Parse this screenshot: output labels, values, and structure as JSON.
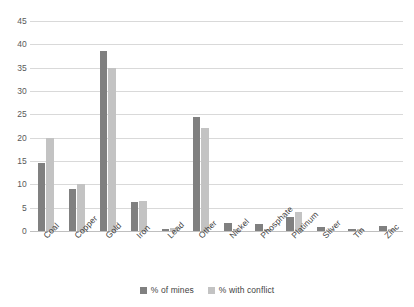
{
  "chart_data": {
    "type": "bar",
    "title": "",
    "subtitle": "",
    "xlabel": "",
    "ylabel": "",
    "ylim": [
      0,
      45
    ],
    "ytick_step": 5,
    "yticks": [
      45,
      40,
      35,
      30,
      25,
      20,
      15,
      10,
      5,
      0
    ],
    "grid": true,
    "legend_position": "bottom",
    "categories": [
      "Coal",
      "Copper",
      "Gold",
      "Iron",
      "Lead",
      "Other",
      "Nickel",
      "Phosphate",
      "Platinum",
      "Silver",
      "Tin",
      "Zinc"
    ],
    "series": [
      {
        "name": "% of mines",
        "color": "#808080",
        "values": [
          14.5,
          9.0,
          38.5,
          6.2,
          0.4,
          24.5,
          1.8,
          1.5,
          3.0,
          0.8,
          0.5,
          1.1
        ]
      },
      {
        "name": "% with conflict",
        "color": "#c3c3c3",
        "values": [
          20.0,
          10.0,
          35.0,
          6.5,
          0.6,
          22.0,
          0.5,
          0.5,
          4.0,
          0.2,
          0.5,
          0.4
        ]
      }
    ]
  },
  "legend": {
    "items": [
      {
        "label": "% of mines"
      },
      {
        "label": "% with conflict"
      }
    ]
  },
  "colors": {
    "series_of_mines": "#808080",
    "series_with_conflict": "#c3c3c3",
    "gridline": "#d9d9d9",
    "axis": "#bfbfbf",
    "text": "#3f3f3f",
    "background": "#ffffff"
  }
}
